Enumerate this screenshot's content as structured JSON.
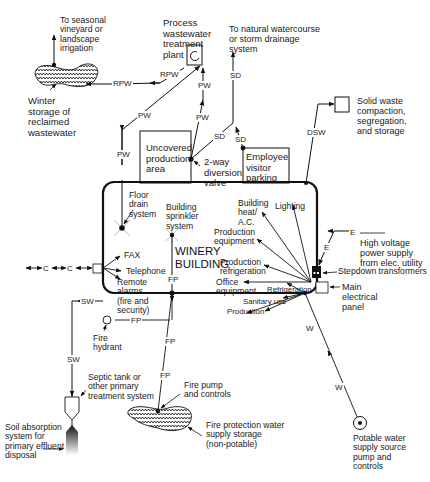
{
  "diagram": {
    "building": {
      "title": "WINERY\nBUILDING"
    },
    "labels": {
      "seasonal_irrigation": "To seasonal\nvineyard or\nlandscape\nirrigation",
      "winter_storage": "Winter\nstorage of\nreclaimed\nwastewater",
      "process_plant": "Process\nwastewater\ntreatment\nplant",
      "natural_watercourse": "To natural watercourse\nor storm drainage\nsystem",
      "solid_waste": "Solid waste\ncompaction,\nsegregation,\nand storage",
      "uncovered_area": "Uncovered\nproduction\narea",
      "diversion_valve": "2-way\ndiversion\nvalve",
      "employee_parking": "Employee\nvisitor\nparking",
      "floor_drain": "Floor\ndrain\nsystem",
      "sprinkler": "Building\nsprinkler\nsystem",
      "heat_ac": "Building\nheat/\nA.C.",
      "lighting": "Lighting",
      "production_equipment": "Production\nequipment",
      "production_refrigeration": "Production\nrefrigeration",
      "office_equipment": "Office\nequipment",
      "refrigeration": "Refrigeration",
      "sanitary_use": "Sanitary use",
      "production": "Production",
      "high_voltage": "High voltage\npower supply\nfrom elec. utility",
      "stepdown": "Stepdown transformers",
      "main_panel": "Main\nelectrical\npanel",
      "fax": "FAX",
      "telephone": "Telephone",
      "remote_alarms": "Remote\nalarms\n(fire and\nsecurity)",
      "fire_hydrant": "Fire\nhydrant",
      "septic_tank": "Septic tank or\nother primary\ntreatment system",
      "soil_absorption": "Soil absorption\nsystem for\nprimary effluent\ndisposal",
      "fire_pump": "Fire pump\nand controls",
      "fire_storage": "Fire protection water\nsupply storage\n(non-potable)",
      "potable_source": "Potable water\nsupply source\npump and\ncontrols"
    },
    "line_codes": {
      "rpw": "RPW",
      "pw": "PW",
      "sd": "SD",
      "dsw": "DSW",
      "e": "E",
      "c": "C",
      "sw": "SW",
      "fp": "FP",
      "w": "W"
    }
  }
}
